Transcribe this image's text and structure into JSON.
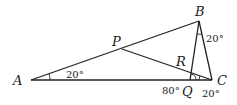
{
  "diagram": {
    "points": {
      "A": {
        "label": "A",
        "x": 31,
        "y": 80
      },
      "B": {
        "label": "B",
        "x": 199,
        "y": 21
      },
      "C": {
        "label": "C",
        "x": 212,
        "y": 80
      },
      "P": {
        "label": "P",
        "x": 122,
        "y": 49
      },
      "Q": {
        "label": "Q",
        "x": 190,
        "y": 80
      },
      "R": {
        "label": "R",
        "x": 191,
        "y": 72
      }
    },
    "segments": [
      "AB",
      "BC",
      "AC",
      "BQ",
      "PC"
    ],
    "angles": {
      "at_A": "20°",
      "at_B": "20°",
      "at_C": "20°",
      "at_Q": "80°"
    }
  }
}
